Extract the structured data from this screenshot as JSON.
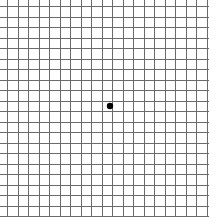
{
  "grid": {
    "title": "Amsler grid",
    "width": 209,
    "height": 217,
    "line_color": "#6a6a6a",
    "line_width": 1,
    "background": "#ffffff",
    "x_start": 7,
    "y_start": 6,
    "spacing": 10.5,
    "columns": 20,
    "rows": 21
  },
  "center_dot": {
    "cx": 110,
    "cy": 106,
    "r": 3.2,
    "color": "#000000"
  }
}
